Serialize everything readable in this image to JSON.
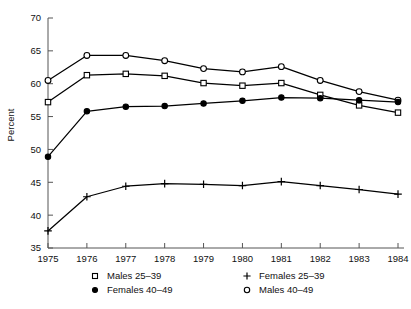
{
  "chart_data": {
    "type": "line",
    "title": "",
    "subtitle": "",
    "xlabel": "",
    "ylabel": "Percent",
    "x": [
      1975,
      1976,
      1977,
      1978,
      1979,
      1980,
      1981,
      1982,
      1983,
      1984
    ],
    "xtick_labels": [
      "1975",
      "1976",
      "1977",
      "1978",
      "1979",
      "1980",
      "1981",
      "1982",
      "1983",
      "1984"
    ],
    "ytick_labels": [
      "35",
      "40",
      "45",
      "50",
      "55",
      "60",
      "65",
      "70"
    ],
    "yticks": [
      35,
      40,
      45,
      50,
      55,
      60,
      65,
      70
    ],
    "xlim": [
      1975,
      1984
    ],
    "ylim": [
      35,
      70
    ],
    "grid": false,
    "legend_position": "below",
    "series": [
      {
        "name": "Males 40–49",
        "marker": "open-circle",
        "values": [
          60.5,
          64.3,
          64.3,
          63.5,
          62.3,
          61.8,
          62.6,
          60.5,
          58.8,
          57.5
        ]
      },
      {
        "name": "Males 25–39",
        "marker": "open-square",
        "values": [
          57.2,
          61.3,
          61.5,
          61.2,
          60.1,
          59.7,
          60.1,
          58.3,
          56.7,
          55.6
        ]
      },
      {
        "name": "Females 40–49",
        "marker": "filled-circle",
        "values": [
          48.9,
          55.8,
          56.5,
          56.6,
          57.0,
          57.4,
          57.9,
          57.8,
          57.5,
          57.2
        ]
      },
      {
        "name": "Females 25–39",
        "marker": "plus",
        "values": [
          37.6,
          42.8,
          44.4,
          44.8,
          44.7,
          44.5,
          45.1,
          44.5,
          43.9,
          43.2
        ]
      }
    ]
  },
  "legend": {
    "entries": [
      {
        "marker": "open-square",
        "label": "Males 25–39"
      },
      {
        "marker": "plus",
        "label": "Females 25–39"
      },
      {
        "marker": "filled-circle",
        "label": "Females 40–49"
      },
      {
        "marker": "open-circle",
        "label": "Males 40–49"
      }
    ]
  },
  "colors": {
    "ink": "#000000",
    "axis": "#555555",
    "background": "#ffffff"
  }
}
